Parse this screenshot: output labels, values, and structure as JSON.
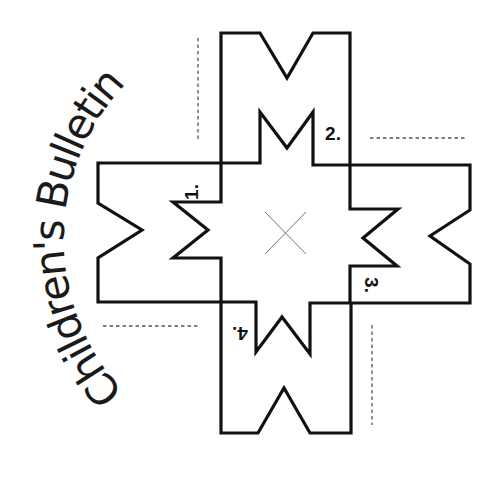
{
  "title": "Children's Bulletin",
  "fold_labels": [
    {
      "id": "1",
      "text": "1."
    },
    {
      "id": "2",
      "text": "2."
    },
    {
      "id": "3",
      "text": "3."
    },
    {
      "id": "4",
      "text": "4."
    }
  ],
  "colors": {
    "background": "#ffffff",
    "outline": "#111111",
    "dashed": "#555555",
    "center_mark": "#777777"
  }
}
